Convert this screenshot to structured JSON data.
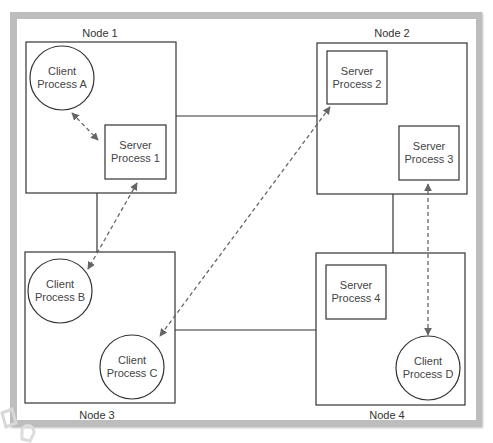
{
  "diagram": {
    "type": "distributed client-server process diagram",
    "colors": {
      "frame": "#bdbdbd",
      "line": "#333333",
      "dashed_arrow": "#666666",
      "background": "#ffffff"
    },
    "nodes": [
      {
        "id": "node1",
        "label": "Node 1"
      },
      {
        "id": "node2",
        "label": "Node 2"
      },
      {
        "id": "node3",
        "label": "Node 3"
      },
      {
        "id": "node4",
        "label": "Node 4"
      }
    ],
    "processes": {
      "client_a": {
        "line1": "Client",
        "line2": "Process A",
        "shape": "circle",
        "node": "Node 1"
      },
      "server_1": {
        "line1": "Server",
        "line2": "Process 1",
        "shape": "rectangle",
        "node": "Node 1"
      },
      "server_2": {
        "line1": "Server",
        "line2": "Process 2",
        "shape": "rectangle",
        "node": "Node 2"
      },
      "server_3": {
        "line1": "Server",
        "line2": "Process 3",
        "shape": "rectangle",
        "node": "Node 2"
      },
      "client_b": {
        "line1": "Client",
        "line2": "Process B",
        "shape": "circle",
        "node": "Node 3"
      },
      "client_c": {
        "line1": "Client",
        "line2": "Process C",
        "shape": "circle",
        "node": "Node 3"
      },
      "server_4": {
        "line1": "Server",
        "line2": "Process 4",
        "shape": "rectangle",
        "node": "Node 4"
      },
      "client_d": {
        "line1": "Client",
        "line2": "Process D",
        "shape": "circle",
        "node": "Node 4"
      }
    },
    "network_links": [
      {
        "from": "Node 1",
        "to": "Node 2"
      },
      {
        "from": "Node 1",
        "to": "Node 3"
      },
      {
        "from": "Node 2",
        "to": "Node 4"
      },
      {
        "from": "Node 3",
        "to": "Node 4"
      }
    ],
    "communications": [
      {
        "from": "Client Process A",
        "to": "Server Process 1",
        "style": "dashed bidirectional"
      },
      {
        "from": "Server Process 1",
        "to": "Client Process B",
        "style": "dashed bidirectional"
      },
      {
        "from": "Server Process 2",
        "to": "Client Process C",
        "style": "dashed bidirectional"
      },
      {
        "from": "Server Process 3",
        "to": "Client Process D",
        "style": "dashed bidirectional"
      }
    ]
  }
}
